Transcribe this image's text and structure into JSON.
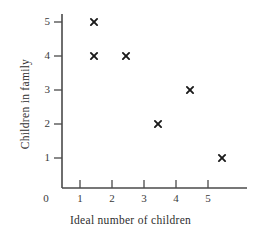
{
  "chart_data": {
    "type": "scatter",
    "title": "",
    "xlabel": "Ideal number of children",
    "ylabel": "Children in family",
    "xlim": [
      0,
      6
    ],
    "ylim": [
      0,
      5.6
    ],
    "xticks": [
      "0",
      "1",
      "2",
      "3",
      "4",
      "5"
    ],
    "xtick_values": [
      0,
      1,
      2,
      3,
      4,
      5
    ],
    "yticks": [
      "1",
      "2",
      "3",
      "4",
      "5"
    ],
    "ytick_values": [
      1,
      2,
      3,
      4,
      5
    ],
    "grid": false,
    "legend": false,
    "marker": "x",
    "marker_color": "#1a1a1a",
    "axis_color": "#4a4a4a",
    "points": [
      {
        "x": 1,
        "y": 5
      },
      {
        "x": 1,
        "y": 4
      },
      {
        "x": 2,
        "y": 4
      },
      {
        "x": 3,
        "y": 2
      },
      {
        "x": 4,
        "y": 3
      },
      {
        "x": 5,
        "y": 1
      }
    ]
  },
  "axes": {
    "x_title": "Ideal number of children",
    "y_title": "Children in family",
    "x_tick_labels": [
      "0",
      "1",
      "2",
      "3",
      "4",
      "5"
    ],
    "y_tick_labels": [
      "1",
      "2",
      "3",
      "4",
      "5"
    ]
  }
}
